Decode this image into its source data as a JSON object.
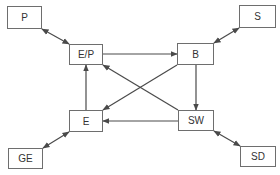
{
  "diagram": {
    "line_color": "#4a4a4a",
    "nodes": [
      {
        "id": "P",
        "label": "P",
        "x": 7,
        "y": 6,
        "w": 35,
        "h": 23
      },
      {
        "id": "EP",
        "label": "E/P",
        "x": 69,
        "y": 44,
        "w": 34,
        "h": 21
      },
      {
        "id": "B",
        "label": "B",
        "x": 177,
        "y": 43,
        "w": 37,
        "h": 22
      },
      {
        "id": "S",
        "label": "S",
        "x": 239,
        "y": 5,
        "w": 37,
        "h": 23
      },
      {
        "id": "E",
        "label": "E",
        "x": 69,
        "y": 110,
        "w": 34,
        "h": 22
      },
      {
        "id": "SW",
        "label": "SW",
        "x": 178,
        "y": 110,
        "w": 36,
        "h": 21
      },
      {
        "id": "GE",
        "label": "GE",
        "x": 8,
        "y": 148,
        "w": 35,
        "h": 21
      },
      {
        "id": "SD",
        "label": "SD",
        "x": 240,
        "y": 146,
        "w": 36,
        "h": 21
      }
    ],
    "edges": [
      {
        "from": "P",
        "to": "EP",
        "type": "bidirectional",
        "x1": 42,
        "y1": 29,
        "x2": 69,
        "y2": 44
      },
      {
        "from": "S",
        "to": "B",
        "type": "bidirectional",
        "x1": 239,
        "y1": 28,
        "x2": 214,
        "y2": 43
      },
      {
        "from": "GE",
        "to": "E",
        "type": "bidirectional",
        "x1": 43,
        "y1": 148,
        "x2": 69,
        "y2": 132
      },
      {
        "from": "SD",
        "to": "SW",
        "type": "bidirectional",
        "x1": 240,
        "y1": 146,
        "x2": 214,
        "y2": 131
      },
      {
        "from": "EP",
        "to": "B",
        "type": "directed",
        "x1": 103,
        "y1": 54,
        "x2": 177,
        "y2": 54
      },
      {
        "from": "B",
        "to": "SW",
        "type": "directed",
        "x1": 196,
        "y1": 65,
        "x2": 196,
        "y2": 110
      },
      {
        "from": "SW",
        "to": "E",
        "type": "directed",
        "x1": 178,
        "y1": 121,
        "x2": 103,
        "y2": 121
      },
      {
        "from": "E",
        "to": "EP",
        "type": "directed",
        "x1": 86,
        "y1": 110,
        "x2": 86,
        "y2": 65
      },
      {
        "from": "B",
        "to": "E",
        "type": "directed",
        "x1": 177,
        "y1": 65,
        "x2": 103,
        "y2": 110
      },
      {
        "from": "SW",
        "to": "EP",
        "type": "directed",
        "x1": 178,
        "y1": 110,
        "x2": 103,
        "y2": 65
      }
    ]
  }
}
